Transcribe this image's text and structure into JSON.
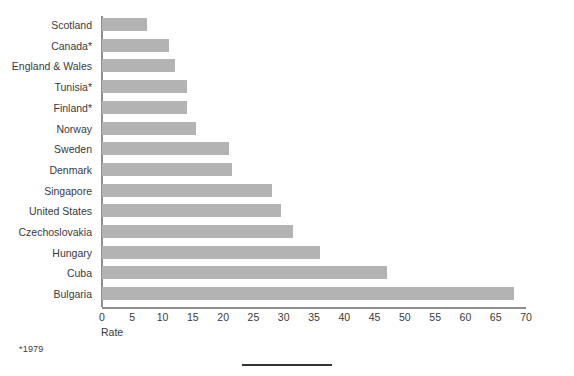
{
  "chart_data": {
    "type": "bar",
    "orientation": "horizontal",
    "title": "",
    "xlabel": "Rate",
    "ylabel": "",
    "xlim": [
      0,
      70
    ],
    "xticks": [
      0,
      5,
      10,
      15,
      20,
      25,
      30,
      35,
      40,
      45,
      50,
      55,
      60,
      65,
      70
    ],
    "grid": false,
    "legend": null,
    "bar_color": "#b3b3b3",
    "axis_color": "#8f8f8f",
    "categories": [
      "Scotland",
      "Canada*",
      "England & Wales",
      "Tunisia*",
      "Finland*",
      "Norway",
      "Sweden",
      "Denmark",
      "Singapore",
      "United States",
      "Czechoslovakia",
      "Hungary",
      "Cuba",
      "Bulgaria"
    ],
    "values": [
      7.5,
      11,
      12,
      14,
      14,
      15.5,
      21,
      21.5,
      28,
      29.5,
      31.5,
      36,
      47,
      68
    ],
    "annotations": [
      "*1979"
    ]
  },
  "footnote": "*1979",
  "axis": {
    "xlabel": "Rate"
  }
}
